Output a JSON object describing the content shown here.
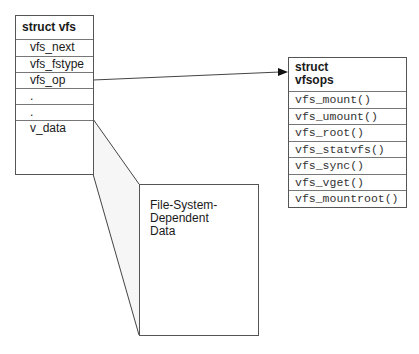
{
  "vfs_struct": {
    "title": "struct vfs",
    "fields": [
      "vfs_next",
      "vfs_fstype",
      "vfs_op",
      ".",
      ".",
      "v_data"
    ]
  },
  "vfsops_struct": {
    "title_line1": "struct",
    "title_line2": "vfsops",
    "fields": [
      "vfs_mount()",
      "vfs_umount()",
      "vfs_root()",
      "vfs_statvfs()",
      "vfs_sync()",
      "vfs_vget()",
      "vfs_mountroot()"
    ]
  },
  "fs_data": {
    "line1": "File-System-",
    "line2": "Dependent",
    "line3": "Data"
  },
  "connections": [
    {
      "from": "vfs_op",
      "to": "struct vfsops",
      "type": "arrow"
    },
    {
      "from": "v_data",
      "to": "File-System-Dependent Data",
      "type": "expansion"
    }
  ]
}
